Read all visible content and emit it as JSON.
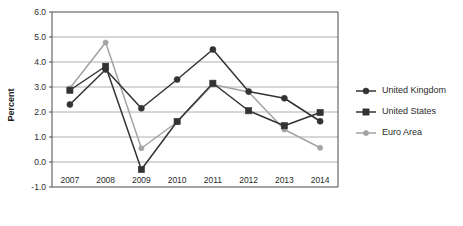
{
  "chart_data": {
    "type": "line",
    "title": "",
    "subtitle": "",
    "xlabel": "",
    "ylabel": "Percent",
    "categories": [
      "2007",
      "2008",
      "2009",
      "2010",
      "2011",
      "2012",
      "2013",
      "2014"
    ],
    "x": [
      2007,
      2008,
      2009,
      2010,
      2011,
      2012,
      2013,
      2014
    ],
    "ylim": [
      -1.0,
      6.0
    ],
    "yticks": [
      "6.0",
      "5.0",
      "4.0",
      "3.0",
      "2.0",
      "1.0",
      "0.0",
      "-1.0"
    ],
    "ytick_values": [
      6.0,
      5.0,
      4.0,
      3.0,
      2.0,
      1.0,
      0.0,
      -1.0
    ],
    "grid": true,
    "grid_axis": "y",
    "legend_position": "right",
    "series": [
      {
        "name": "United Kingdom",
        "marker": "circle",
        "color": "#333333",
        "values": [
          2.3,
          3.7,
          2.15,
          3.3,
          4.5,
          2.82,
          2.55,
          1.63
        ]
      },
      {
        "name": "United States",
        "marker": "square",
        "color": "#333333",
        "values": [
          2.87,
          3.83,
          -0.3,
          1.62,
          3.15,
          2.05,
          1.45,
          1.98
        ]
      },
      {
        "name": "Euro Area",
        "marker": "circle-small",
        "color": "#a3a3a3",
        "values": [
          2.95,
          4.78,
          0.55,
          1.6,
          3.1,
          2.8,
          1.3,
          0.57
        ]
      }
    ]
  },
  "legend": {
    "entries": [
      {
        "label": "United Kingdom"
      },
      {
        "label": "United States"
      },
      {
        "label": "Euro Area"
      }
    ]
  },
  "axes": {
    "y_axis_title": "Percent"
  }
}
